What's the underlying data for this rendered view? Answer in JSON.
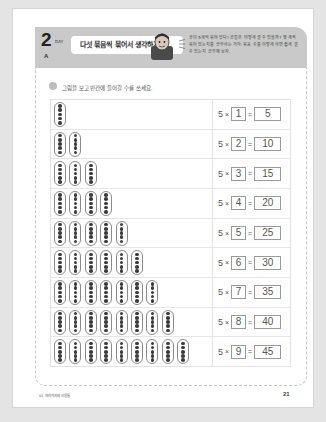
{
  "header": {
    "day_number": "2",
    "day_label": "DAY",
    "day_letter": "A",
    "title": "다섯 묶음씩 묶어서 생각하기",
    "description": "공이 5개씩 묶여 있다! 공들은 어떻게 셀 수 있을까? 몇 개씩 묶어 있는지를 공부하는 거야. 묶음 수를 이렇게 하면 쉽게 셀 수 있는지 공부해 보자.",
    "mascot_icon": "boy-mascot-icon"
  },
  "instruction": {
    "text": "그림을 보고 빈칸에 들어갈 수를 쓰세요."
  },
  "table": {
    "dots_per_stick": 5,
    "rows": [
      {
        "sticks": 1,
        "base": "5",
        "times": "×",
        "multiplier": "1",
        "equals": "=",
        "result": "5"
      },
      {
        "sticks": 2,
        "base": "5",
        "times": "×",
        "multiplier": "2",
        "equals": "=",
        "result": "10"
      },
      {
        "sticks": 3,
        "base": "5",
        "times": "×",
        "multiplier": "3",
        "equals": "=",
        "result": "15"
      },
      {
        "sticks": 4,
        "base": "5",
        "times": "×",
        "multiplier": "4",
        "equals": "=",
        "result": "20"
      },
      {
        "sticks": 5,
        "base": "5",
        "times": "×",
        "multiplier": "5",
        "equals": "=",
        "result": "25"
      },
      {
        "sticks": 6,
        "base": "5",
        "times": "×",
        "multiplier": "6",
        "equals": "=",
        "result": "30"
      },
      {
        "sticks": 7,
        "base": "5",
        "times": "×",
        "multiplier": "7",
        "equals": "=",
        "result": "35"
      },
      {
        "sticks": 8,
        "base": "5",
        "times": "×",
        "multiplier": "8",
        "equals": "=",
        "result": "40"
      },
      {
        "sticks": 9,
        "base": "5",
        "times": "×",
        "multiplier": "9",
        "equals": "=",
        "result": "45"
      }
    ]
  },
  "footer": {
    "left_text": "01 여러가지의 선물들",
    "page_number": "21"
  }
}
